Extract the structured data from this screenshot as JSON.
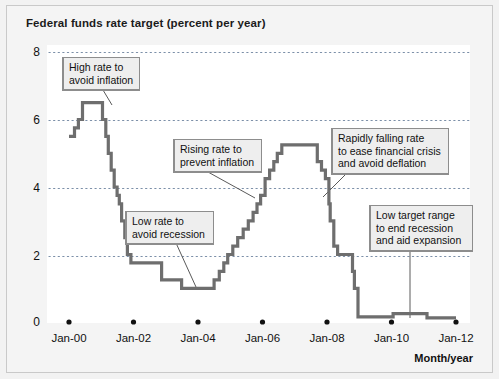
{
  "figure": {
    "title": "Federal funds rate target (percent per year)",
    "axis_caption": "Month/year"
  },
  "chart_data": {
    "type": "line",
    "subtype": "step",
    "title": "Federal funds rate target (percent per year)",
    "xlabel": "Month/year",
    "ylabel": "",
    "xlim": [
      "Jan-00",
      "Jan-12"
    ],
    "ylim": [
      0,
      8
    ],
    "grid": true,
    "legend": "none",
    "line_color": "#6e6e6e",
    "grid_color": "#7b8fa8",
    "y_ticks": [
      "0",
      "2",
      "4",
      "6",
      "8"
    ],
    "y_tick_values": [
      0,
      2,
      4,
      6,
      8
    ],
    "x_ticks": [
      "Jan-00",
      "Jan-02",
      "Jan-04",
      "Jan-06",
      "Jan-08",
      "Jan-10",
      "Jan-12"
    ],
    "x_tick_values": [
      2000.0,
      2002.0,
      2004.0,
      2006.0,
      2008.0,
      2010.0,
      2012.0
    ],
    "series": [
      {
        "name": "Federal funds rate target",
        "points": [
          [
            2000.0,
            5.5
          ],
          [
            2000.17,
            5.75
          ],
          [
            2000.29,
            6.0
          ],
          [
            2000.42,
            6.5
          ],
          [
            2001.0,
            6.5
          ],
          [
            2001.04,
            6.0
          ],
          [
            2001.14,
            5.5
          ],
          [
            2001.22,
            5.0
          ],
          [
            2001.31,
            4.5
          ],
          [
            2001.4,
            4.0
          ],
          [
            2001.49,
            3.75
          ],
          [
            2001.56,
            3.5
          ],
          [
            2001.63,
            3.0
          ],
          [
            2001.73,
            2.5
          ],
          [
            2001.81,
            2.0
          ],
          [
            2001.92,
            1.75
          ],
          [
            2002.87,
            1.25
          ],
          [
            2003.49,
            1.0
          ],
          [
            2004.5,
            1.25
          ],
          [
            2004.66,
            1.5
          ],
          [
            2004.8,
            1.75
          ],
          [
            2004.92,
            2.0
          ],
          [
            2005.08,
            2.25
          ],
          [
            2005.23,
            2.5
          ],
          [
            2005.4,
            2.75
          ],
          [
            2005.56,
            3.0
          ],
          [
            2005.71,
            3.25
          ],
          [
            2005.83,
            3.5
          ],
          [
            2005.94,
            3.75
          ],
          [
            2006.08,
            4.25
          ],
          [
            2006.22,
            4.5
          ],
          [
            2006.35,
            4.75
          ],
          [
            2006.46,
            5.0
          ],
          [
            2006.6,
            5.25
          ],
          [
            2007.7,
            4.75
          ],
          [
            2007.83,
            4.5
          ],
          [
            2007.95,
            4.25
          ],
          [
            2008.06,
            3.5
          ],
          [
            2008.1,
            3.0
          ],
          [
            2008.21,
            2.25
          ],
          [
            2008.33,
            2.0
          ],
          [
            2008.79,
            1.5
          ],
          [
            2008.85,
            1.0
          ],
          [
            2008.96,
            0.15
          ],
          [
            2009.9,
            0.15
          ],
          [
            2010.05,
            0.25
          ],
          [
            2011.0,
            0.25
          ],
          [
            2011.1,
            0.12
          ],
          [
            2012.0,
            0.12
          ]
        ]
      }
    ],
    "annotations": [
      {
        "id": "high-rate",
        "text": "High rate to\navoid inflation",
        "lines": [
          "High rate to",
          "avoid inflation"
        ],
        "target": [
          2000.6,
          6.5
        ]
      },
      {
        "id": "rising-rate",
        "text": "Rising rate to\nprevent inflation",
        "lines": [
          "Rising rate to",
          "prevent inflation"
        ],
        "target": [
          2005.5,
          3.0
        ]
      },
      {
        "id": "low-rate",
        "text": "Low rate to\navoid recession",
        "lines": [
          "Low rate to",
          "avoid recession"
        ],
        "target": [
          2003.9,
          1.0
        ]
      },
      {
        "id": "rapidly-falling",
        "text": "Rapidly falling rate\nto ease financial crisis\nand avoid deflation",
        "lines": [
          "Rapidly falling rate",
          "to ease financial crisis",
          "and avoid deflation"
        ],
        "target": [
          2007.95,
          4.2
        ]
      },
      {
        "id": "low-target-range",
        "text": "Low target range\nto end recession\nand aid expansion",
        "lines": [
          "Low target range",
          "to end recession",
          "and aid expansion"
        ],
        "target": [
          2010.35,
          0.25
        ]
      }
    ]
  }
}
